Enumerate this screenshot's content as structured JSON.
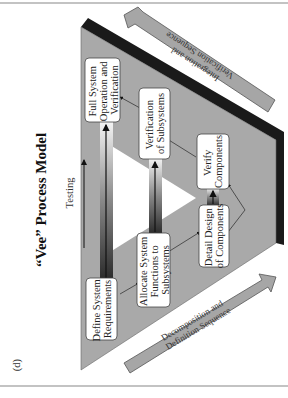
{
  "figure": {
    "panel_label": "(d)",
    "title": "“Vee” Process Model",
    "testing_label": "Testing",
    "orientation": "rotated 90 degrees counter-clockwise",
    "colors": {
      "vee_fill": "#a9a9a9",
      "shadow_band": "#1a1a1a",
      "box_fill": "#ffffff",
      "sequence_arrow_fill": "#a6a6a6",
      "text": "#222222"
    },
    "boxes": [
      {
        "id": "define",
        "lines": [
          "Define System",
          "Requirements"
        ]
      },
      {
        "id": "allocate",
        "lines": [
          "Allocate System",
          "Functions to",
          "Subsystems"
        ]
      },
      {
        "id": "detail",
        "lines": [
          "Detail Design",
          "of Components"
        ]
      },
      {
        "id": "verify-components",
        "lines": [
          "Verify",
          "Components"
        ]
      },
      {
        "id": "verify-subsystems",
        "lines": [
          "Verification",
          "of Subsystems"
        ]
      },
      {
        "id": "full-system",
        "lines": [
          "Full System",
          "Operation and",
          "Verification"
        ]
      }
    ],
    "sequences": {
      "decomposition": [
        "Decomposition and",
        "Definition Sequence"
      ],
      "integration": [
        "Integration and",
        "Verification Sequence"
      ]
    }
  }
}
